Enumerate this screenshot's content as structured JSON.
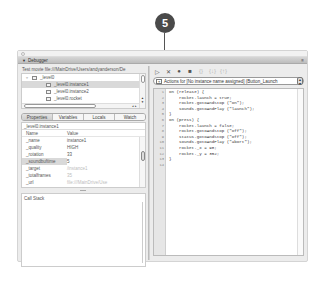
{
  "callout": {
    "number": "5"
  },
  "window": {
    "title": "Debugger",
    "menu_icon": "≡"
  },
  "left": {
    "test_file": "Test movie file:///MainDrive/Users/andyanderson/De",
    "tree": [
      {
        "label": "_level0",
        "indent": 0,
        "expanded": true,
        "selected": false
      },
      {
        "label": "_level0.instance1",
        "indent": 1,
        "selected": true
      },
      {
        "label": "_level0.instance2",
        "indent": 1,
        "selected": false
      },
      {
        "label": "_level0.rocket",
        "indent": 1,
        "selected": false
      },
      {
        "label": "_level0.smokeTrail",
        "indent": 1,
        "selected": false
      }
    ],
    "tabs": [
      {
        "label": "Properties",
        "active": true
      },
      {
        "label": "Variables",
        "active": false
      },
      {
        "label": "Locals",
        "active": false
      },
      {
        "label": "Watch",
        "active": false
      }
    ],
    "props_path": "_level0.instance1",
    "props_header": {
      "name": "Name",
      "value": "Value"
    },
    "props": [
      {
        "name": "_name",
        "value": "instance1",
        "dim": false,
        "selected": false
      },
      {
        "name": "_quality",
        "value": "HIGH",
        "dim": false,
        "selected": false
      },
      {
        "name": "_rotation",
        "value": "33",
        "dim": false,
        "selected": false
      },
      {
        "name": "_soundbuftime",
        "value": "5",
        "dim": false,
        "selected": true
      },
      {
        "name": "_target",
        "value": "/instance1",
        "dim": true,
        "selected": false
      },
      {
        "name": "_totalframes",
        "value": "35",
        "dim": true,
        "selected": false
      },
      {
        "name": "_url",
        "value": "file:///MainDrive/Use",
        "dim": true,
        "selected": false
      }
    ],
    "call_stack_label": "Call Stack"
  },
  "right": {
    "toolbar": [
      {
        "name": "continue-icon",
        "glyph": "▷",
        "light": false
      },
      {
        "name": "stop-debugging-icon",
        "glyph": "✕",
        "light": false
      },
      {
        "name": "toggle-breakpoint-icon",
        "glyph": "●",
        "light": false
      },
      {
        "name": "remove-breakpoints-icon",
        "glyph": "■",
        "light": false
      },
      {
        "name": "step-over-icon",
        "glyph": "{}",
        "light": true
      },
      {
        "name": "step-in-icon",
        "glyph": "{↓}",
        "light": true
      },
      {
        "name": "step-out-icon",
        "glyph": "{↑}",
        "light": true
      }
    ],
    "actions_label": "Actions for",
    "actions_value": "[No instance name assigned] (Button_Launch",
    "code": [
      {
        "n": "1",
        "html": "on (release) {"
      },
      {
        "n": "2",
        "html": "    rocket.launch = true;"
      },
      {
        "n": "3",
        "html": "    rocket.gotoAndStop (\"on\");"
      },
      {
        "n": "4",
        "html": "    sounds.gotoAndPlay (\"launch\");"
      },
      {
        "n": "5",
        "html": "}"
      },
      {
        "n": "6",
        "html": "on (press) {"
      },
      {
        "n": "7",
        "html": "    rocket.launch = false;"
      },
      {
        "n": "8",
        "html": "    rocket.gotoAndStop (\"off\");"
      },
      {
        "n": "9",
        "html": "    status.gotoAndStop (\"off\");"
      },
      {
        "n": "10",
        "html": "    sounds.gotoAndPlay (\"abort\");"
      },
      {
        "n": "11",
        "html": "    rocket._x = 98;"
      },
      {
        "n": "12",
        "html": "    rocket._y = 352;"
      },
      {
        "n": "13",
        "html": "}"
      },
      {
        "n": "14",
        "html": ""
      }
    ]
  }
}
